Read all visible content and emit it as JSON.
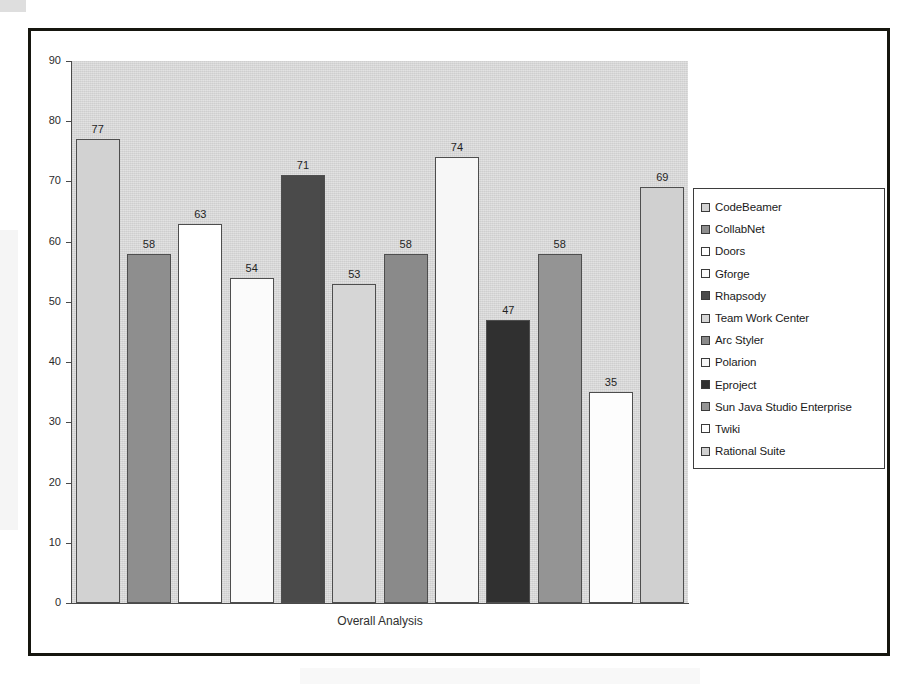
{
  "chart_data": {
    "type": "bar",
    "title": "",
    "xlabel": "Overall Analysis",
    "ylabel": "",
    "ylim": [
      0,
      90
    ],
    "ytick_step": 10,
    "yticks": [
      90,
      80,
      70,
      60,
      50,
      40,
      30,
      20,
      10,
      0
    ],
    "grid": false,
    "legend_position": "right",
    "categories": [
      "CodeBeamer",
      "CollabNet",
      "Doors",
      "Gforge",
      "Rhapsody",
      "Team Work Center",
      "Arc Styler",
      "Polarion",
      "Eproject",
      "Sun Java Studio Enterprise",
      "Twiki",
      "Rational Suite"
    ],
    "values": [
      77,
      58,
      63,
      54,
      71,
      53,
      58,
      74,
      47,
      58,
      35,
      69
    ],
    "colors": [
      "#d2d2d2",
      "#8e8e8e",
      "#ffffff",
      "#fbfbfb",
      "#4a4a4a",
      "#d6d6d6",
      "#8a8a8a",
      "#f7f7f7",
      "#303030",
      "#949494",
      "#fdfdfd",
      "#d0d0d0"
    ],
    "plot_background": "#d9d9d9",
    "bar_border_color": "#4e4e4e",
    "axis_color": "#4a4a4a",
    "frame_color": "#16160f"
  },
  "legend": {
    "entries": [
      {
        "label": "CodeBeamer",
        "color": "#d2d2d2"
      },
      {
        "label": "CollabNet",
        "color": "#8e8e8e"
      },
      {
        "label": "Doors",
        "color": "#ffffff"
      },
      {
        "label": "Gforge",
        "color": "#fbfbfb"
      },
      {
        "label": "Rhapsody",
        "color": "#4a4a4a"
      },
      {
        "label": "Team Work Center",
        "color": "#d6d6d6"
      },
      {
        "label": "Arc Styler",
        "color": "#8a8a8a"
      },
      {
        "label": "Polarion",
        "color": "#f7f7f7"
      },
      {
        "label": "Eproject",
        "color": "#303030"
      },
      {
        "label": "Sun Java Studio Enterprise",
        "color": "#949494"
      },
      {
        "label": "Twiki",
        "color": "#fdfdfd"
      },
      {
        "label": "Rational Suite",
        "color": "#d0d0d0"
      }
    ]
  },
  "axis": {
    "x_title": "Overall Analysis"
  }
}
